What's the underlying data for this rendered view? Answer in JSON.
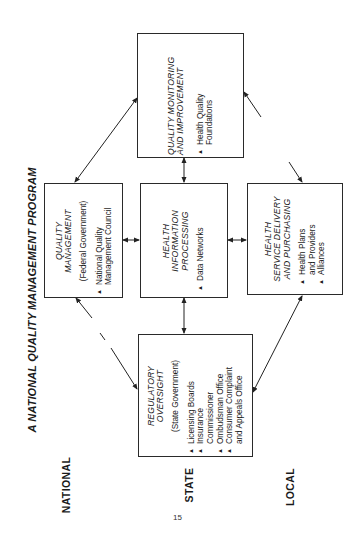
{
  "diagram": {
    "title": "A NATIONAL QUALITY MANAGEMENT PROGRAM",
    "levels": {
      "national": "NATIONAL",
      "state": "STATE",
      "local": "LOCAL"
    },
    "page_number": "15",
    "boxes": {
      "quality_monitoring": {
        "title_line1": "QUALITY MONITORING",
        "title_line2": "AND IMPROVEMENT",
        "items": [
          "Health Quality",
          "Foundations"
        ]
      },
      "quality_management": {
        "title_line1": "QUALITY",
        "title_line2": "MANAGEMENT",
        "subtitle": "(Federal  Government)",
        "items": [
          "National Quality",
          "Management Council"
        ]
      },
      "health_information": {
        "title_line1": "HEALTH",
        "title_line2": "INFORMATION",
        "title_line3": "PROCESSING",
        "items": [
          "Data Networks"
        ]
      },
      "health_service": {
        "title_line1": "HEALTH",
        "title_line2": "SERVICE DELIVERY",
        "title_line3": "AND PURCHASING",
        "items": [
          "Health Plans",
          "and Providers",
          "Alliances"
        ]
      },
      "regulatory_oversight": {
        "title_line1": "REGULATORY",
        "title_line2": "OVERSIGHT",
        "subtitle": "(State  Government)",
        "items": [
          "Licensing Boards",
          "Insurance",
          "Commissioner",
          "Ombudsman Office",
          "Consumer Complaint",
          "and Appeals Office"
        ]
      }
    },
    "bullet_glyph": "▲",
    "connections": [
      {
        "from": "quality_management",
        "to": "quality_monitoring",
        "style": "solid",
        "arrows": "both"
      },
      {
        "from": "health_information",
        "to": "quality_monitoring",
        "style": "solid",
        "arrows": "both"
      },
      {
        "from": "health_service",
        "to": "quality_monitoring",
        "style": "broken",
        "arrows": "both"
      },
      {
        "from": "quality_management",
        "to": "health_information",
        "style": "solid",
        "arrows": "both"
      },
      {
        "from": "health_information",
        "to": "health_service",
        "style": "solid",
        "arrows": "both"
      },
      {
        "from": "quality_management",
        "to": "regulatory_oversight",
        "style": "dashed",
        "arrows": "both"
      },
      {
        "from": "health_information",
        "to": "regulatory_oversight",
        "style": "solid",
        "arrows": "both"
      },
      {
        "from": "health_service",
        "to": "regulatory_oversight",
        "style": "solid",
        "arrows": "both"
      }
    ]
  }
}
